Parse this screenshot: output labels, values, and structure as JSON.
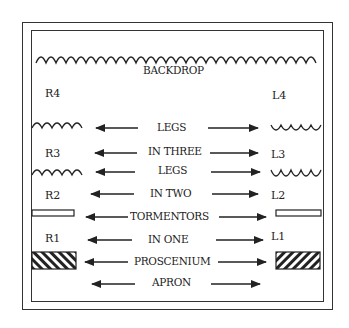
{
  "diagram": {
    "backdrop": "BACKDROP",
    "positions": {
      "right": [
        "R4",
        "R3",
        "R2",
        "R1"
      ],
      "left": [
        "L4",
        "L3",
        "L2",
        "L1"
      ]
    },
    "rows": [
      {
        "label": "LEGS"
      },
      {
        "label": "IN THREE"
      },
      {
        "label": "LEGS"
      },
      {
        "label": "IN TWO"
      },
      {
        "label": "TORMENTORS"
      },
      {
        "label": "IN ONE"
      },
      {
        "label": "PROSCENIUM"
      },
      {
        "label": "APRON"
      }
    ]
  }
}
